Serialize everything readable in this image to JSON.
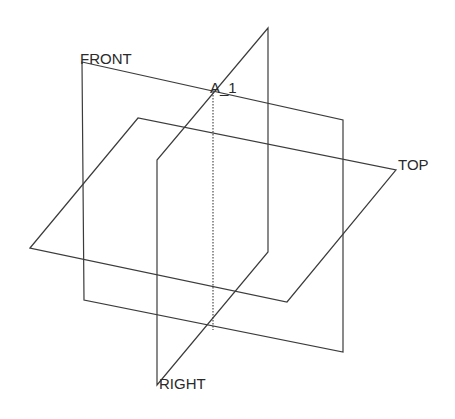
{
  "diagram": {
    "type": "datum-planes",
    "colors": {
      "background": "#ffffff",
      "line": "#3c3c3c",
      "text": "#2a2a2a"
    },
    "planes": [
      {
        "id": "front",
        "label": "FRONT",
        "points": "82,62 343,120 343,352 84,300"
      },
      {
        "id": "top",
        "label": "TOP",
        "points": "30,248 138,118 396,170 287,302"
      },
      {
        "id": "right",
        "label": "RIGHT",
        "points": "268,28 268,252 157,385 157,160"
      }
    ],
    "axis": {
      "id": "a1",
      "label": "A_1",
      "x1": 213,
      "y1": 92,
      "x2": 213,
      "y2": 330
    }
  }
}
